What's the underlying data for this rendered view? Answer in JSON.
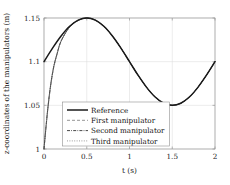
{
  "chart_data": {
    "type": "line",
    "title": "",
    "xlabel": "t (s)",
    "ylabel": "z-coordinates of the manipulators (m)",
    "xlim": [
      0,
      2
    ],
    "ylim": [
      1,
      1.15
    ],
    "xticks": [
      "0",
      "0.5",
      "1",
      "1.5",
      "2"
    ],
    "xtick_values": [
      0,
      0.5,
      1,
      1.5,
      2
    ],
    "yticks": [
      "1",
      "1.05",
      "1.1",
      "1.15"
    ],
    "ytick_values": [
      1,
      1.05,
      1.1,
      1.15
    ],
    "grid": true,
    "legend_position": "lower-center-left",
    "series": [
      {
        "name": "Reference",
        "style": "solid-thick",
        "color": "#1a1a1a",
        "x": [
          0,
          0.1,
          0.2,
          0.3,
          0.4,
          0.5,
          0.6,
          0.7,
          0.8,
          0.9,
          1.0,
          1.1,
          1.2,
          1.3,
          1.4,
          1.5,
          1.6,
          1.7,
          1.8,
          1.9,
          2.0
        ],
        "y": [
          1.1,
          1.1155,
          1.1294,
          1.1405,
          1.1476,
          1.15,
          1.1476,
          1.1405,
          1.1294,
          1.1155,
          1.1,
          1.0845,
          1.0706,
          1.0595,
          1.0524,
          1.05,
          1.0524,
          1.0595,
          1.0706,
          1.0845,
          1.1
        ]
      },
      {
        "name": "First manipulator",
        "style": "dashed",
        "color": "#4d4d4d",
        "x": [
          0,
          0.02,
          0.04,
          0.06,
          0.08,
          0.1,
          0.12,
          0.15,
          0.2,
          0.3,
          0.4,
          0.5,
          0.6,
          0.7,
          0.8,
          0.9,
          1.0,
          1.1,
          1.2,
          1.3,
          1.4,
          1.5,
          1.6,
          1.7,
          1.8,
          1.9,
          2.0
        ],
        "y": [
          1.0,
          1.0215,
          1.0415,
          1.0592,
          1.0742,
          1.0866,
          1.0966,
          1.1078,
          1.1235,
          1.1397,
          1.1472,
          1.15,
          1.1476,
          1.1405,
          1.1294,
          1.1155,
          1.1,
          1.0845,
          1.0706,
          1.0595,
          1.0524,
          1.05,
          1.0524,
          1.0595,
          1.0706,
          1.0845,
          1.1
        ]
      },
      {
        "name": "Second manipulator",
        "style": "dash-dot",
        "color": "#333333",
        "x": [
          0,
          0.02,
          0.04,
          0.06,
          0.08,
          0.1,
          0.12,
          0.15,
          0.2,
          0.3,
          0.4,
          0.5,
          0.6,
          0.7,
          0.8,
          0.9,
          1.0,
          1.1,
          1.2,
          1.3,
          1.4,
          1.5,
          1.6,
          1.7,
          1.8,
          1.9,
          2.0
        ],
        "y": [
          1.0,
          1.0222,
          1.0425,
          1.0602,
          1.0751,
          1.0874,
          1.0972,
          1.1082,
          1.1237,
          1.1398,
          1.1473,
          1.15,
          1.1476,
          1.1405,
          1.1294,
          1.1155,
          1.1,
          1.0845,
          1.0706,
          1.0595,
          1.0524,
          1.05,
          1.0524,
          1.0595,
          1.0706,
          1.0845,
          1.1
        ]
      },
      {
        "name": "Third manipulator",
        "style": "dotted",
        "color": "#595959",
        "x": [
          0,
          0.02,
          0.04,
          0.06,
          0.08,
          0.1,
          0.12,
          0.15,
          0.2,
          0.3,
          0.4,
          0.5,
          0.6,
          0.7,
          0.8,
          0.9,
          1.0,
          1.1,
          1.2,
          1.3,
          1.4,
          1.5,
          1.6,
          1.7,
          1.8,
          1.9,
          2.0
        ],
        "y": [
          1.0,
          1.0208,
          1.0405,
          1.0582,
          1.0733,
          1.0858,
          1.096,
          1.1074,
          1.1233,
          1.1396,
          1.1471,
          1.15,
          1.1476,
          1.1405,
          1.1294,
          1.1155,
          1.1,
          1.0845,
          1.0706,
          1.0595,
          1.0524,
          1.05,
          1.0524,
          1.0595,
          1.0706,
          1.0845,
          1.1
        ]
      }
    ],
    "legend_entries": [
      "Reference",
      "First manipulator",
      "Second manipulator",
      "Third manipulator"
    ]
  }
}
